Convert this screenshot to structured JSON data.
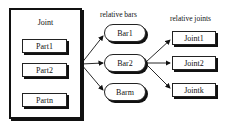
{
  "joint_box": {
    "title": "Joint",
    "parts": [
      "Part1",
      "Part2",
      "Partn"
    ]
  },
  "bars_group": {
    "label": "relative bars",
    "bars": [
      "Bar1",
      "Bar2",
      "Barm"
    ]
  },
  "joints_group": {
    "label": "relative joints",
    "joints": [
      "Joint1",
      "Joint2",
      "Jointk"
    ]
  },
  "colors": {
    "stroke": "#111111",
    "background": "#ffffff"
  }
}
